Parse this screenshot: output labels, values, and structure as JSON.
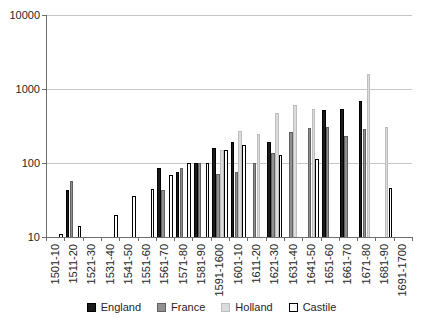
{
  "chart_data": {
    "type": "bar",
    "title": "",
    "xlabel": "",
    "ylabel": "",
    "y_scale": "log",
    "ylim": [
      10,
      10000
    ],
    "y_ticks": [
      10,
      100,
      1000,
      10000
    ],
    "grid": true,
    "legend_position": "bottom",
    "categories": [
      "1501-10",
      "1511-20",
      "1521-30",
      "1531-40",
      "1541-50",
      "1551-60",
      "1561-70",
      "1571-80",
      "1581-90",
      "1591-1600",
      "1601-10",
      "1611-20",
      "1621-30",
      "1631-40",
      "1641-50",
      "1651-60",
      "1661-70",
      "1671-80",
      "1681-90",
      "1691-1700"
    ],
    "series": [
      {
        "name": "England",
        "fill": "#1a1a1a",
        "border": "#000000",
        "values": [
          null,
          43,
          null,
          null,
          null,
          null,
          85,
          75,
          100,
          160,
          195,
          null,
          195,
          null,
          null,
          520,
          530,
          680,
          null,
          null
        ]
      },
      {
        "name": "France",
        "fill": "#909090",
        "border": "#606060",
        "values": [
          null,
          58,
          null,
          null,
          null,
          null,
          43,
          85,
          100,
          72,
          76,
          100,
          135,
          260,
          295,
          310,
          235,
          285,
          null,
          null
        ]
      },
      {
        "name": "Holland",
        "fill": "#dcdcdc",
        "border": "#bdbdbd",
        "values": [
          null,
          null,
          null,
          null,
          null,
          null,
          null,
          null,
          null,
          150,
          270,
          245,
          480,
          600,
          530,
          null,
          null,
          1600,
          310,
          null
        ]
      },
      {
        "name": "Castile",
        "fill": "#ffffff",
        "border": "#000000",
        "values": [
          11,
          14,
          null,
          20,
          36,
          45,
          70,
          100,
          100,
          150,
          175,
          null,
          128,
          null,
          112,
          null,
          null,
          null,
          46,
          null
        ]
      }
    ],
    "colors": {
      "grid": "#c6c6c6",
      "axis": "#6e6e6e",
      "text": "#262626",
      "background": "#ffffff"
    }
  }
}
